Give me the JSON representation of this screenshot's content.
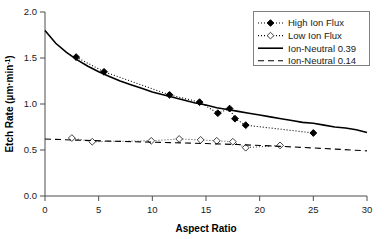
{
  "chart_data": {
    "type": "scatter",
    "title": "",
    "xlabel": "Aspect Ratio",
    "ylabel": "Etch Rate (µm·min⁻¹)",
    "ylabel_parts": {
      "main": "Etch Rate (µm·min",
      "sup": "-1",
      "tail": ")"
    },
    "xlim": [
      0,
      30
    ],
    "ylim": [
      0,
      2.0
    ],
    "xticks": [
      0,
      5,
      10,
      15,
      20,
      25,
      30
    ],
    "xtick_labels": [
      "0",
      "5",
      "10",
      "15",
      "20",
      "25",
      "30"
    ],
    "yticks": [
      0.0,
      0.5,
      1.0,
      1.5,
      2.0
    ],
    "ytick_labels": [
      "0.0",
      "0.5",
      "1.0",
      "1.5",
      "2.0"
    ],
    "grid": false,
    "legend_position": "top-right",
    "series": [
      {
        "name": "High Ion Flux",
        "marker": "filled-diamond",
        "line": "dotted",
        "color": "#000000",
        "points": [
          {
            "x": 2.9,
            "y": 1.51
          },
          {
            "x": 5.5,
            "y": 1.35
          },
          {
            "x": 11.6,
            "y": 1.1
          },
          {
            "x": 14.4,
            "y": 1.02
          },
          {
            "x": 16.1,
            "y": 0.9
          },
          {
            "x": 17.2,
            "y": 0.95
          },
          {
            "x": 17.7,
            "y": 0.84
          },
          {
            "x": 18.7,
            "y": 0.77
          },
          {
            "x": 25.0,
            "y": 0.685
          }
        ]
      },
      {
        "name": "Low Ion Flux",
        "marker": "open-diamond",
        "line": "dotted",
        "color": "#555555",
        "points": [
          {
            "x": 2.5,
            "y": 0.63
          },
          {
            "x": 4.4,
            "y": 0.59
          },
          {
            "x": 9.9,
            "y": 0.6
          },
          {
            "x": 12.5,
            "y": 0.62
          },
          {
            "x": 14.5,
            "y": 0.61
          },
          {
            "x": 16.0,
            "y": 0.6
          },
          {
            "x": 17.5,
            "y": 0.59
          },
          {
            "x": 18.7,
            "y": 0.525
          },
          {
            "x": 21.9,
            "y": 0.55
          }
        ]
      },
      {
        "name": "Ion-Neutral 0.39",
        "marker": "none",
        "line": "solid",
        "color": "#000000",
        "points": [
          {
            "x": 0,
            "y": 1.8
          },
          {
            "x": 1,
            "y": 1.66
          },
          {
            "x": 2,
            "y": 1.56
          },
          {
            "x": 3,
            "y": 1.48
          },
          {
            "x": 4,
            "y": 1.41
          },
          {
            "x": 5,
            "y": 1.35
          },
          {
            "x": 6,
            "y": 1.3
          },
          {
            "x": 7,
            "y": 1.25
          },
          {
            "x": 8,
            "y": 1.21
          },
          {
            "x": 9,
            "y": 1.17
          },
          {
            "x": 10,
            "y": 1.13
          },
          {
            "x": 11,
            "y": 1.1
          },
          {
            "x": 12,
            "y": 1.07
          },
          {
            "x": 13,
            "y": 1.04
          },
          {
            "x": 14,
            "y": 1.01
          },
          {
            "x": 15,
            "y": 0.99
          },
          {
            "x": 16,
            "y": 0.96
          },
          {
            "x": 17,
            "y": 0.94
          },
          {
            "x": 18,
            "y": 0.92
          },
          {
            "x": 19,
            "y": 0.9
          },
          {
            "x": 20,
            "y": 0.88
          },
          {
            "x": 21,
            "y": 0.86
          },
          {
            "x": 22,
            "y": 0.84
          },
          {
            "x": 23,
            "y": 0.82
          },
          {
            "x": 24,
            "y": 0.8
          },
          {
            "x": 25,
            "y": 0.79
          },
          {
            "x": 26,
            "y": 0.77
          },
          {
            "x": 27,
            "y": 0.75
          },
          {
            "x": 28,
            "y": 0.74
          },
          {
            "x": 29,
            "y": 0.72
          },
          {
            "x": 30,
            "y": 0.69
          }
        ]
      },
      {
        "name": "Ion-Neutral 0.14",
        "marker": "none",
        "line": "dashed",
        "color": "#000000",
        "points": [
          {
            "x": 0,
            "y": 0.62
          },
          {
            "x": 3,
            "y": 0.607
          },
          {
            "x": 6,
            "y": 0.597
          },
          {
            "x": 9,
            "y": 0.588
          },
          {
            "x": 12,
            "y": 0.579
          },
          {
            "x": 15,
            "y": 0.57
          },
          {
            "x": 18,
            "y": 0.559
          },
          {
            "x": 21,
            "y": 0.545
          },
          {
            "x": 24,
            "y": 0.528
          },
          {
            "x": 27,
            "y": 0.51
          },
          {
            "x": 30,
            "y": 0.49
          }
        ]
      }
    ]
  },
  "legend": {
    "items": [
      {
        "label": "High Ion Flux",
        "marker": "filled-diamond",
        "line": "dotted"
      },
      {
        "label": "Low Ion Flux",
        "marker": "open-diamond",
        "line": "dotted"
      },
      {
        "label": "Ion-Neutral 0.39",
        "marker": "none",
        "line": "solid"
      },
      {
        "label": "Ion-Neutral 0.14",
        "marker": "none",
        "line": "dashed"
      }
    ]
  },
  "colors": {
    "axis": "#4d4d4d",
    "series_high": "#000000",
    "series_low": "#555555",
    "legend_border": "#808080",
    "background": "#ffffff"
  }
}
